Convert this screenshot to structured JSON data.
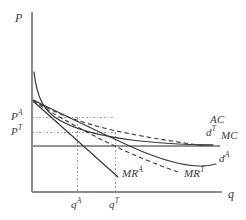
{
  "figure": {
    "kind": "economics-diagram",
    "background_color": "#ffffff",
    "axis_color": "#7a7a84",
    "curve_color": "#3a3a3a",
    "guide_color": "#9a9aa2"
  },
  "axes": {
    "y_label": "P",
    "x_label": "q",
    "y_axis_x": 32,
    "y_axis_top": 12,
    "x_axis_y": 192,
    "x_axis_right": 222
  },
  "price_ticks": [
    {
      "id": "PA",
      "base": "P",
      "sup": "A",
      "y": 117
    },
    {
      "id": "PT",
      "base": "P",
      "sup": "T",
      "y": 132
    }
  ],
  "quantity_ticks": [
    {
      "id": "qA",
      "base": "q",
      "sup": "A",
      "x": 77
    },
    {
      "id": "qT",
      "base": "q",
      "sup": "T",
      "x": 115
    }
  ],
  "curves": [
    {
      "id": "AC",
      "base": "AC",
      "sup": "",
      "style": "solid",
      "label_x": 210,
      "label_y": 117
    },
    {
      "id": "MC",
      "base": "MC",
      "sup": "",
      "style": "solid",
      "label_x": 222,
      "label_y": 132
    },
    {
      "id": "dT",
      "base": "d",
      "sup": "T",
      "style": "dashed",
      "label_x": 206,
      "label_y": 129
    },
    {
      "id": "dA",
      "base": "d",
      "sup": "A",
      "style": "solid",
      "label_x": 219,
      "label_y": 155
    },
    {
      "id": "MRA",
      "base": "MR",
      "sup": "A",
      "style": "solid",
      "label_x": 122,
      "label_y": 170
    },
    {
      "id": "MRT",
      "base": "MR",
      "sup": "T",
      "style": "dashed",
      "label_x": 184,
      "label_y": 170
    }
  ]
}
